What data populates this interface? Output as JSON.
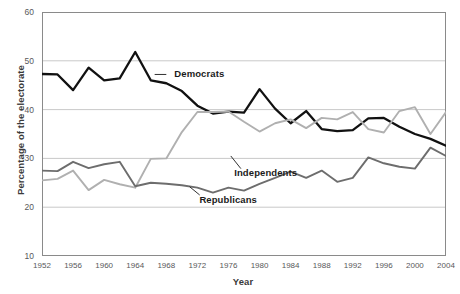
{
  "chart_data": {
    "type": "line",
    "title": "",
    "xlabel": "Year",
    "ylabel": "Percentage of the electorate",
    "xlim": [
      1952,
      2004
    ],
    "ylim": [
      10,
      60
    ],
    "yticks": [
      10,
      20,
      30,
      40,
      50,
      60
    ],
    "xticks": [
      1952,
      1956,
      1960,
      1964,
      1968,
      1972,
      1976,
      1980,
      1984,
      1988,
      1992,
      1996,
      2000,
      2004
    ],
    "grid": true,
    "grid_axis": "y",
    "legend_position": "inline-annotations",
    "x": [
      1952,
      1954,
      1956,
      1958,
      1960,
      1962,
      1964,
      1966,
      1968,
      1970,
      1972,
      1974,
      1976,
      1978,
      1980,
      1982,
      1984,
      1986,
      1988,
      1990,
      1992,
      1994,
      1996,
      1998,
      2000,
      2002,
      2004
    ],
    "series": [
      {
        "name": "Democrats",
        "color": "#111111",
        "values": [
          47.3,
          47.2,
          44.0,
          48.6,
          46.0,
          46.4,
          51.8,
          46.0,
          45.4,
          43.8,
          40.8,
          39.2,
          39.6,
          39.4,
          44.2,
          40.2,
          37.2,
          39.7,
          36.0,
          35.6,
          35.8,
          38.2,
          38.3,
          36.5,
          35.0,
          34.0,
          32.6
        ],
        "annotation": {
          "text": "Democrats",
          "x": 1968,
          "y": 47.2
        }
      },
      {
        "name": "Independents",
        "color": "#b0b0b0",
        "values": [
          25.5,
          25.8,
          27.5,
          23.5,
          25.6,
          24.7,
          24.0,
          29.9,
          30.0,
          35.4,
          39.5,
          39.5,
          39.6,
          37.5,
          35.5,
          37.2,
          38.0,
          36.2,
          38.3,
          38.0,
          39.5,
          36.0,
          35.3,
          39.7,
          40.5,
          35.0,
          39.5
        ],
        "annotation": {
          "text": "Independents",
          "x": 1977,
          "y": 27.0
        }
      },
      {
        "name": "Republicans",
        "color": "#6d6d6d",
        "values": [
          27.5,
          27.4,
          29.3,
          28.0,
          28.8,
          29.3,
          24.3,
          25.0,
          24.8,
          24.5,
          24.0,
          23.0,
          24.0,
          23.4,
          24.8,
          26.0,
          27.3,
          26.0,
          27.5,
          25.2,
          26.0,
          30.2,
          29.0,
          28.3,
          27.9,
          32.2,
          30.5
        ],
        "annotation": {
          "text": "Republicans",
          "x": 1972,
          "y": 21.5
        }
      }
    ]
  },
  "axis": {
    "yticks": [
      "10",
      "20",
      "30",
      "40",
      "50",
      "60"
    ],
    "xticks": [
      "1952",
      "1956",
      "1960",
      "1964",
      "1968",
      "1972",
      "1976",
      "1980",
      "1984",
      "1988",
      "1992",
      "1996",
      "2000",
      "2004"
    ],
    "ylabel": "Percentage of the electorate",
    "xlabel": "Year"
  },
  "labels": {
    "democrats": "Democrats",
    "independents": "Independents",
    "republicans": "Republicans"
  },
  "colors": {
    "democrats": "#111111",
    "independents": "#b0b0b0",
    "republicans": "#6d6d6d",
    "grid": "#c9c9c9",
    "frame": "#8a8a8a",
    "text": "#58585a"
  }
}
